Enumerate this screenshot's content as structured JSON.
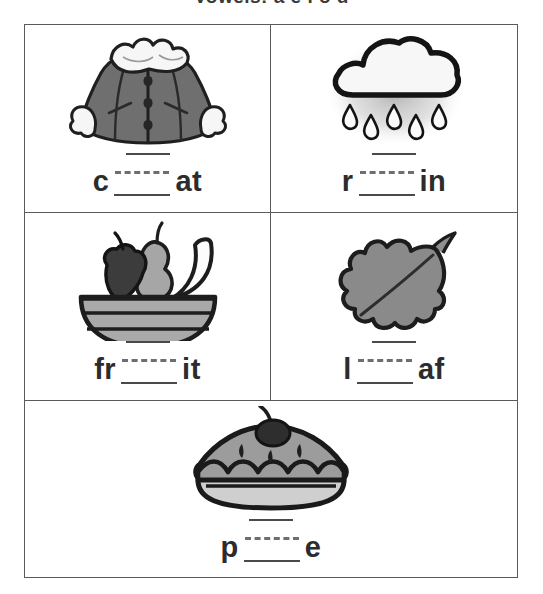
{
  "worksheet": {
    "title": "Vowels:  a  e  i  o  u",
    "grid": {
      "rows": [
        {
          "cells": [
            {
              "id": "coat",
              "image_name": "coat-illustration",
              "image_alt": "gray winter coat with white fur collar and cuffs and three buttons",
              "word_prefix": "c",
              "word_suffix": "at",
              "answer": "coat"
            },
            {
              "id": "rain",
              "image_name": "rain-cloud-illustration",
              "image_alt": "white cloud with five falling raindrops",
              "word_prefix": "r",
              "word_suffix": "in",
              "answer": "rain"
            }
          ]
        },
        {
          "cells": [
            {
              "id": "fruit",
              "image_name": "fruit-bowl-illustration",
              "image_alt": "striped bowl holding an apple, a pear and a banana",
              "word_prefix": "fr",
              "word_suffix": "it",
              "answer": "fruit"
            },
            {
              "id": "leaf",
              "image_name": "leaf-illustration",
              "image_alt": "gray lobed oak leaf with center vein and stem",
              "word_prefix": "l",
              "word_suffix": "af",
              "answer": "leaf"
            }
          ]
        },
        {
          "cells": [
            {
              "id": "pie",
              "image_name": "pie-illustration",
              "image_alt": "gray pie with scalloped crust, vent slits and a cherry on top",
              "word_prefix": "p",
              "word_suffix": "e",
              "answer": "pie"
            }
          ]
        }
      ]
    },
    "colors": {
      "border": "#5a5a5a",
      "ink": "#2c2c2c",
      "rule": "#4a4a4a",
      "dash": "#6e6e6e",
      "art_gray": "#7f7f7f",
      "art_dark": "#3a3a3a",
      "art_light": "#b5b5b5",
      "page": "#ffffff"
    }
  }
}
